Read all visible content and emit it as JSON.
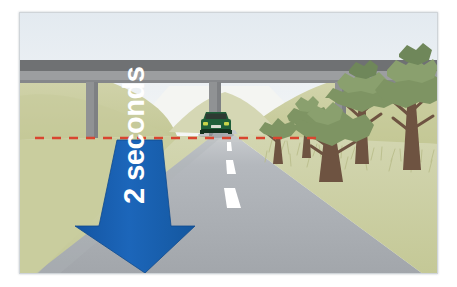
{
  "illustration": {
    "title": "Two second following distance illustration",
    "alt_description": "A rural road passing under a concrete overpass bridge. A dark green car travels away from the viewer. A red dashed line crosses the road at the car's position and a large blue downward arrow labelled '2 seconds' spans the gap between the red line and the viewer.",
    "annotation": {
      "arrow_label": "2 seconds",
      "arrow_direction": "down",
      "arrow_color": "#1a62b3",
      "arrow_label_color": "#ffffff",
      "reference_line_label": "",
      "reference_line_color": "#d9452f",
      "reference_line_style": "dashed"
    },
    "scene": {
      "sky_color": "#e9eef2",
      "hill_color": "#cdd0a3",
      "hill_shadow_color": "#bfc394",
      "grass_color": "#c7cb9c",
      "road_color": "#a7abb0",
      "road_far_color": "#b8bcc1",
      "road_shoulder_color": "#d5d7b2",
      "lane_marking_color": "#ffffff",
      "bridge_deck_color": "#6f7173",
      "bridge_beam_color": "#9a9c9e",
      "bridge_pillar_color": "#8e9092",
      "tree_trunk_color": "#6e5341",
      "tree_foliage_color": "#7e9463",
      "tree_foliage_dark_color": "#5f7a4c",
      "car_body_color": "#1f5f3a",
      "car_dark_color": "#14331f",
      "car_window_color": "#2a2f2b",
      "car_light_color": "#c8d44a"
    },
    "objects": [
      {
        "name": "overpass-bridge",
        "label": "Concrete overpass bridge"
      },
      {
        "name": "car",
        "label": "Dark green car driving away"
      },
      {
        "name": "trees",
        "label": "Roadside trees"
      },
      {
        "name": "hills",
        "label": "Grassy hills"
      },
      {
        "name": "road",
        "label": "Two-lane road"
      },
      {
        "name": "lane-markings",
        "label": "White dashed centre line"
      },
      {
        "name": "reference-line",
        "label": "Red dashed reference line"
      },
      {
        "name": "distance-arrow",
        "label": "Blue two seconds arrow"
      }
    ]
  }
}
